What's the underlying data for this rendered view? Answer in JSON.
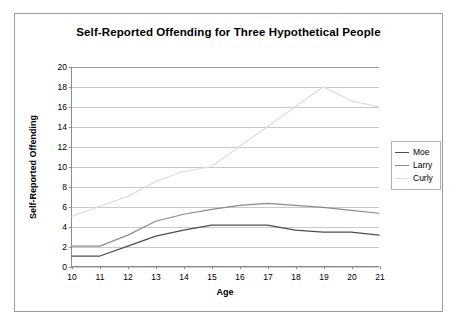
{
  "figure": {
    "title": "Self-Reported Offending for Three Hypothetical People",
    "border_color": "#9a9a9a",
    "background": "#ffffff"
  },
  "chart_data": {
    "type": "line",
    "title": "Self-Reported Offending for Three Hypothetical People",
    "xlabel": "Age",
    "ylabel": "Self-Reported Offending",
    "x": [
      10,
      11,
      12,
      13,
      14,
      15,
      16,
      17,
      18,
      19,
      20,
      21
    ],
    "categories": [
      "10",
      "11",
      "12",
      "13",
      "14",
      "15",
      "16",
      "17",
      "18",
      "19",
      "20",
      "21"
    ],
    "xlim": [
      10,
      21
    ],
    "ylim": [
      0,
      20
    ],
    "ytick_values": [
      0,
      2,
      4,
      6,
      8,
      10,
      12,
      14,
      16,
      18,
      20
    ],
    "ytick_labels": [
      "0",
      "2",
      "4",
      "6",
      "8",
      "10",
      "12",
      "14",
      "16",
      "18",
      "20"
    ],
    "grid": "horizontal",
    "legend_position": "right",
    "series": [
      {
        "name": "Moe",
        "color": "#4d4d4d",
        "values": [
          1.0,
          1.0,
          2.0,
          3.0,
          3.6,
          4.1,
          4.1,
          4.1,
          3.6,
          3.4,
          3.4,
          3.1
        ]
      },
      {
        "name": "Larry",
        "color": "#8c8c8c",
        "values": [
          2.0,
          2.0,
          3.1,
          4.5,
          5.2,
          5.7,
          6.1,
          6.3,
          6.1,
          5.9,
          5.6,
          5.3
        ]
      },
      {
        "name": "Curly",
        "color": "#dcdcdc",
        "values": [
          5.0,
          6.0,
          7.0,
          8.5,
          9.5,
          10.0,
          12.0,
          14.0,
          16.0,
          18.0,
          16.6,
          16.0
        ]
      }
    ]
  },
  "legend": {
    "entries": [
      {
        "label": "Moe",
        "color": "#4d4d4d"
      },
      {
        "label": "Larry",
        "color": "#8c8c8c"
      },
      {
        "label": "Curly",
        "color": "#dcdcdc"
      }
    ]
  }
}
